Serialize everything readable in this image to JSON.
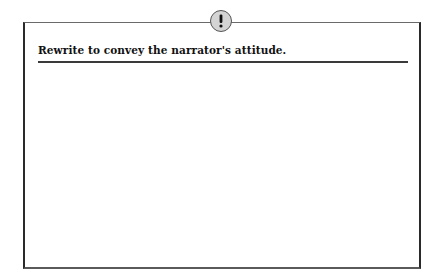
{
  "prompt": {
    "icon": "exclamation-icon",
    "heading": "Rewrite to convey the narrator's attitude.",
    "answer_value": ""
  },
  "colors": {
    "border": "#2a2a2a",
    "badge_fill": "#d4d4d4",
    "badge_outline": "#555555",
    "text": "#111111"
  }
}
